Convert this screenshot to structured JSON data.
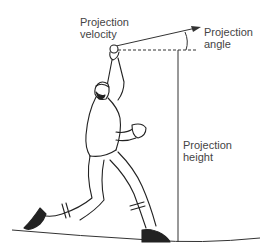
{
  "diagram": {
    "labels": {
      "velocity": "Projection\nvelocity",
      "angle": "Projection\nangle",
      "height": "Projection\nheight"
    },
    "colors": {
      "line": "#333333",
      "text": "#444444"
    }
  }
}
